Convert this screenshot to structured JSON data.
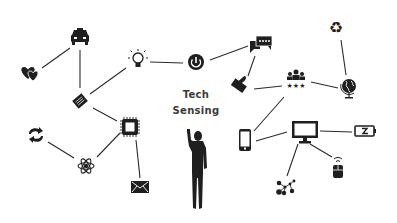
{
  "diagram": {
    "title_line1": "Tech",
    "title_line2": "Sensing",
    "colors": {
      "icon": "#1f1f1f",
      "line": "#2b2b2b",
      "text": "#3a3a3a",
      "background": "#ffffff"
    },
    "nodes": [
      {
        "id": "taxi",
        "icon": "taxi-icon",
        "x": 80,
        "y": 37
      },
      {
        "id": "hearts",
        "icon": "hearts-icon",
        "x": 30,
        "y": 73
      },
      {
        "id": "book",
        "icon": "book-icon",
        "x": 80,
        "y": 101
      },
      {
        "id": "lightbulb",
        "icon": "lightbulb-icon",
        "x": 138,
        "y": 60
      },
      {
        "id": "power",
        "icon": "power-icon",
        "x": 196,
        "y": 62
      },
      {
        "id": "chat",
        "icon": "chat-icon",
        "x": 262,
        "y": 44
      },
      {
        "id": "thumbs-up",
        "icon": "thumbs-up-icon",
        "x": 240,
        "y": 84
      },
      {
        "id": "group",
        "icon": "group-rating-icon",
        "x": 296,
        "y": 80
      },
      {
        "id": "recycle",
        "icon": "recycle-icon",
        "x": 336,
        "y": 28
      },
      {
        "id": "globe",
        "icon": "globe-icon",
        "x": 349,
        "y": 88
      },
      {
        "id": "chip",
        "icon": "chip-icon",
        "x": 130,
        "y": 127
      },
      {
        "id": "sync",
        "icon": "sync-icon",
        "x": 36,
        "y": 135
      },
      {
        "id": "atom",
        "icon": "atom-icon",
        "x": 86,
        "y": 166
      },
      {
        "id": "mail",
        "icon": "mail-icon",
        "x": 140,
        "y": 187
      },
      {
        "id": "phone",
        "icon": "smartphone-icon",
        "x": 245,
        "y": 140
      },
      {
        "id": "monitor",
        "icon": "monitor-icon",
        "x": 305,
        "y": 130
      },
      {
        "id": "battery",
        "icon": "battery-icon",
        "x": 365,
        "y": 131
      },
      {
        "id": "network",
        "icon": "network-icon",
        "x": 285,
        "y": 187
      },
      {
        "id": "mouse",
        "icon": "wireless-mouse-icon",
        "x": 338,
        "y": 170
      }
    ],
    "edges": [
      [
        "taxi",
        "hearts"
      ],
      [
        "taxi",
        "book"
      ],
      [
        "book",
        "lightbulb"
      ],
      [
        "book",
        "chip"
      ],
      [
        "lightbulb",
        "power"
      ],
      [
        "power",
        "chat"
      ],
      [
        "chat",
        "thumbs-up"
      ],
      [
        "thumbs-up",
        "group"
      ],
      [
        "group",
        "globe"
      ],
      [
        "recycle",
        "globe"
      ],
      [
        "group",
        "phone"
      ],
      [
        "phone",
        "monitor"
      ],
      [
        "monitor",
        "battery"
      ],
      [
        "monitor",
        "network"
      ],
      [
        "monitor",
        "mouse"
      ],
      [
        "chip",
        "atom"
      ],
      [
        "chip",
        "mail"
      ],
      [
        "sync",
        "atom"
      ]
    ]
  }
}
